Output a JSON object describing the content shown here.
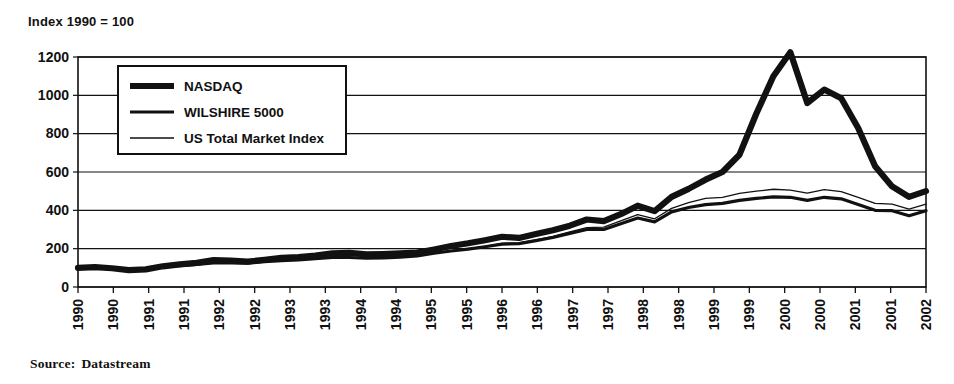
{
  "figure": {
    "title": "Index 1990 = 100",
    "source_label": "Source:",
    "source_value": "Datastream"
  },
  "chart_data": {
    "type": "line",
    "title": "Index 1990 = 100",
    "xlabel": "",
    "ylabel": "",
    "ylim": [
      0,
      1200
    ],
    "yticks": [
      0,
      200,
      400,
      600,
      800,
      1000,
      1200
    ],
    "grid": true,
    "legend_position": "top-left",
    "xlim": [
      "1990-H1",
      "2002-H2"
    ],
    "xtick_labels": [
      "1990",
      "1990",
      "1991",
      "1991",
      "1992",
      "1992",
      "1993",
      "1993",
      "1994",
      "1994",
      "1995",
      "1995",
      "1996",
      "1996",
      "1997",
      "1997",
      "1998",
      "1998",
      "1999",
      "1999",
      "2000",
      "2000",
      "2001",
      "2001",
      "2002"
    ],
    "x": [
      1990.0,
      1990.25,
      1990.5,
      1990.75,
      1991.0,
      1991.25,
      1991.5,
      1991.75,
      1992.0,
      1992.25,
      1992.5,
      1992.75,
      1993.0,
      1993.25,
      1993.5,
      1993.75,
      1994.0,
      1994.25,
      1994.5,
      1994.75,
      1995.0,
      1995.25,
      1995.5,
      1995.75,
      1996.0,
      1996.25,
      1996.5,
      1996.75,
      1997.0,
      1997.25,
      1997.5,
      1997.75,
      1998.0,
      1998.25,
      1998.5,
      1998.75,
      1999.0,
      1999.25,
      1999.5,
      1999.75,
      2000.0,
      2000.25,
      2000.5,
      2000.75,
      2001.0,
      2001.25,
      2001.5,
      2001.75,
      2002.0,
      2002.25,
      2002.5
    ],
    "series": [
      {
        "name": "NASDAQ",
        "line_width": "thick",
        "values": [
          100,
          104,
          98,
          88,
          92,
          108,
          118,
          126,
          140,
          138,
          132,
          142,
          152,
          156,
          164,
          176,
          178,
          170,
          172,
          176,
          180,
          196,
          214,
          228,
          244,
          262,
          256,
          276,
          296,
          320,
          352,
          344,
          380,
          424,
          396,
          470,
          512,
          560,
          600,
          690,
          905,
          1100,
          1225,
          960,
          1030,
          985,
          830,
          630,
          525,
          470,
          500
        ],
        "end_value": 500,
        "peak_value": 1225,
        "peak_x": "2000-H1"
      },
      {
        "name": "WILSHIRE 5000",
        "line_width": "medium",
        "values": [
          100,
          103,
          96,
          86,
          90,
          104,
          112,
          118,
          126,
          126,
          124,
          132,
          138,
          142,
          148,
          154,
          154,
          150,
          152,
          156,
          162,
          176,
          188,
          198,
          210,
          224,
          226,
          242,
          258,
          280,
          300,
          300,
          330,
          360,
          340,
          392,
          415,
          430,
          436,
          452,
          462,
          470,
          468,
          452,
          468,
          460,
          430,
          400,
          398,
          372,
          398
        ],
        "end_value": 398
      },
      {
        "name": "US Total Market Index",
        "line_width": "thin",
        "values": [
          102,
          105,
          98,
          88,
          92,
          106,
          114,
          120,
          128,
          128,
          126,
          134,
          140,
          144,
          150,
          156,
          156,
          152,
          154,
          158,
          164,
          178,
          190,
          200,
          212,
          228,
          230,
          246,
          264,
          288,
          310,
          312,
          345,
          378,
          356,
          410,
          440,
          462,
          468,
          488,
          500,
          510,
          505,
          490,
          508,
          498,
          468,
          436,
          432,
          406,
          432
        ],
        "end_value": 432
      }
    ]
  },
  "legend": {
    "items": [
      {
        "label": "NASDAQ",
        "width": "thick"
      },
      {
        "label": "WILSHIRE 5000",
        "width": "medium"
      },
      {
        "label": "US Total Market Index",
        "width": "thin"
      }
    ]
  },
  "colors": {
    "ink": "#111111",
    "background": "#ffffff"
  }
}
